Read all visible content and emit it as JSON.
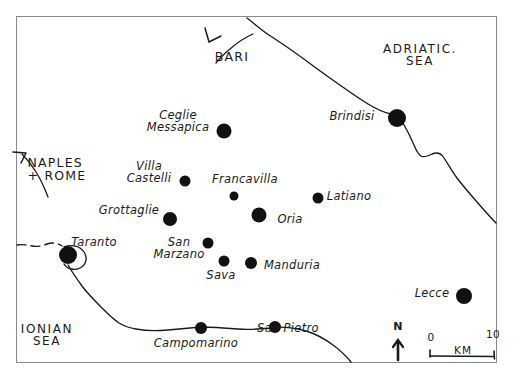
{
  "map": {
    "title": "Hand-drawn map of the Salento / Puglia region, southern Italy",
    "frame": {
      "x": 16,
      "y": 16,
      "width": 481,
      "height": 347
    },
    "ink_color": "#111111",
    "paper_color": "#ffffff",
    "border_color": "#8a8a8a"
  },
  "sea_labels": [
    {
      "id": "adriatic-sea",
      "text": "ADRIATIC.\nSEA",
      "x": 420,
      "y": 55
    },
    {
      "id": "ionian-sea",
      "text": "IONIAN\nSEA",
      "x": 47,
      "y": 335
    }
  ],
  "direction_labels": [
    {
      "id": "bari",
      "text": "BARI",
      "x": 232,
      "y": 57
    },
    {
      "id": "naples-rome",
      "text": "NAPLES\n+ ROME",
      "x": 57,
      "y": 170
    }
  ],
  "cities": [
    {
      "id": "brindisi",
      "name": "Brindisi",
      "dot_x": 397,
      "dot_y": 118,
      "dot_r": 9.0,
      "label_x": 352,
      "label_y": 117,
      "label_lines": "Brindisi",
      "align": "right"
    },
    {
      "id": "ceglie-messapica",
      "name": "Ceglie\nMessapica",
      "dot_x": 224,
      "dot_y": 131,
      "dot_r": 7.5,
      "label_x": 178,
      "label_y": 122,
      "label_lines": "Ceglie\nMessapica",
      "align": "center"
    },
    {
      "id": "villa-castelli",
      "name": "Villa\nCastelli",
      "dot_x": 185,
      "dot_y": 181,
      "dot_r": 5.5,
      "label_x": 149,
      "label_y": 173,
      "label_lines": "Villa\nCastelli",
      "align": "center"
    },
    {
      "id": "francavilla",
      "name": "Francavilla",
      "dot_x": 234,
      "dot_y": 196,
      "dot_r": 4.5,
      "label_x": 245,
      "label_y": 180,
      "label_lines": "Francavilla",
      "align": "left"
    },
    {
      "id": "latiano",
      "name": "Latiano",
      "dot_x": 318,
      "dot_y": 198,
      "dot_r": 5.5,
      "label_x": 349,
      "label_y": 197,
      "label_lines": "Latiano",
      "align": "left"
    },
    {
      "id": "grottaglie",
      "name": "Grottaglie",
      "dot_x": 170,
      "dot_y": 219,
      "dot_r": 7.0,
      "label_x": 129,
      "label_y": 211,
      "label_lines": "Grottaglie",
      "align": "center"
    },
    {
      "id": "oria",
      "name": "Oria",
      "dot_x": 259,
      "dot_y": 215,
      "dot_r": 7.5,
      "label_x": 290,
      "label_y": 220,
      "label_lines": "Oria",
      "align": "left"
    },
    {
      "id": "taranto",
      "name": "Taranto",
      "dot_x": 68,
      "dot_y": 255,
      "dot_r": 9.0,
      "label_x": 94,
      "label_y": 243,
      "label_lines": "Taranto",
      "align": "left"
    },
    {
      "id": "san-marzano",
      "name": "San\nMarzano",
      "dot_x": 208,
      "dot_y": 243,
      "dot_r": 5.5,
      "label_x": 179,
      "label_y": 249,
      "label_lines": "San\nMarzano",
      "align": "center"
    },
    {
      "id": "sava",
      "name": "Sava",
      "dot_x": 224,
      "dot_y": 261,
      "dot_r": 5.5,
      "label_x": 221,
      "label_y": 276,
      "label_lines": "Sava",
      "align": "center"
    },
    {
      "id": "manduria",
      "name": "Manduria",
      "dot_x": 251,
      "dot_y": 263,
      "dot_r": 6.0,
      "label_x": 292,
      "label_y": 266,
      "label_lines": "Manduria",
      "align": "left"
    },
    {
      "id": "lecce",
      "name": "Lecce",
      "dot_x": 464,
      "dot_y": 296,
      "dot_r": 8.0,
      "label_x": 432,
      "label_y": 294,
      "label_lines": "Lecce",
      "align": "right"
    },
    {
      "id": "san-pietro",
      "name": "San Pietro",
      "dot_x": 275,
      "dot_y": 327,
      "dot_r": 6.0,
      "label_x": 288,
      "label_y": 329,
      "label_lines": "San Pietro",
      "align": "left"
    },
    {
      "id": "campomarino",
      "name": "Campomarino",
      "dot_x": 201,
      "dot_y": 328,
      "dot_r": 6.0,
      "label_x": 196,
      "label_y": 344,
      "label_lines": "Campomarino",
      "align": "center"
    }
  ],
  "scale_bar": {
    "north_label": "N",
    "left_value": "0",
    "right_value": "10",
    "unit": "KM",
    "x": 392,
    "y": 330
  }
}
